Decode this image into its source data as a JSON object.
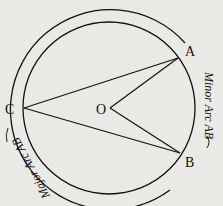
{
  "diagram": {
    "points": {
      "A": {
        "label": "A",
        "x": 178,
        "y": 58
      },
      "B": {
        "label": "B",
        "x": 180,
        "y": 153
      },
      "C": {
        "label": "C",
        "x": 24,
        "y": 108
      },
      "O": {
        "label": "O",
        "x": 110,
        "y": 108
      }
    },
    "circle": {
      "cx": 109,
      "cy": 108,
      "r": 86
    },
    "segments": [
      [
        "C",
        "A"
      ],
      [
        "C",
        "B"
      ],
      [
        "O",
        "A"
      ],
      [
        "O",
        "B"
      ]
    ],
    "arc_labels": {
      "minor": "Minor Arc AB",
      "major": "Major Arc AB"
    },
    "colors": {
      "stroke": "#111111",
      "background": "#e9e9e6"
    }
  }
}
